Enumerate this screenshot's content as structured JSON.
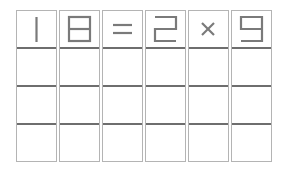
{
  "puzzle": {
    "type": "matchstick-equation",
    "equation": [
      "1",
      "8",
      "=",
      "2",
      "×",
      "9"
    ],
    "rows": 4,
    "columns": 6,
    "cells": [
      [
        "1",
        "8",
        "=",
        "2",
        "×",
        "9"
      ],
      [
        "",
        "",
        "",
        "",
        "",
        ""
      ],
      [
        "",
        "",
        "",
        "",
        "",
        ""
      ],
      [
        "",
        "",
        "",
        "",
        "",
        ""
      ]
    ]
  },
  "colors": {
    "glyph": "#7a7a7a",
    "cell_border": "#b4b4b4",
    "row_divider": "#6e6e6e",
    "background": "#ffffff"
  }
}
